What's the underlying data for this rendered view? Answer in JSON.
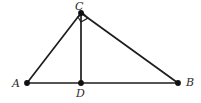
{
  "figure": {
    "kind": "geometry-diagram",
    "background_color": "#ffffff",
    "stroke_color": "#1d1d1d",
    "label_color": "#2b2b2b",
    "width": 201,
    "height": 103
  },
  "points": [
    {
      "id": "C",
      "label": "C",
      "x": 81,
      "y": 13,
      "label_x": 75,
      "label_y": 1
    },
    {
      "id": "A",
      "label": "A",
      "x": 27,
      "y": 83,
      "label_x": 12,
      "label_y": 78
    },
    {
      "id": "B",
      "label": "B",
      "x": 178,
      "y": 83,
      "label_x": 186,
      "label_y": 77
    },
    {
      "id": "D",
      "label": "D",
      "x": 81,
      "y": 83,
      "label_x": 76,
      "label_y": 88
    }
  ],
  "segments": [
    {
      "id": "AC",
      "from": "A",
      "to": "C",
      "x1": 27,
      "y1": 83,
      "x2": 81,
      "y2": 13,
      "width": 1.7
    },
    {
      "id": "CB",
      "from": "C",
      "to": "B",
      "x1": 81,
      "y1": 13,
      "x2": 178,
      "y2": 83,
      "width": 1.7
    },
    {
      "id": "AB",
      "from": "A",
      "to": "B",
      "x1": 27,
      "y1": 83,
      "x2": 178,
      "y2": 83,
      "width": 1.7
    },
    {
      "id": "CD",
      "from": "C",
      "to": "D",
      "x1": 81,
      "y1": 13,
      "x2": 81,
      "y2": 83,
      "width": 1.7
    }
  ],
  "angle_markers": [
    {
      "id": "right-angle-at-C",
      "at": "C",
      "type": "right-angle-square",
      "points": "81,22 88,18 83,13 78,17"
    }
  ],
  "vertex_dot_radius": 2.6
}
